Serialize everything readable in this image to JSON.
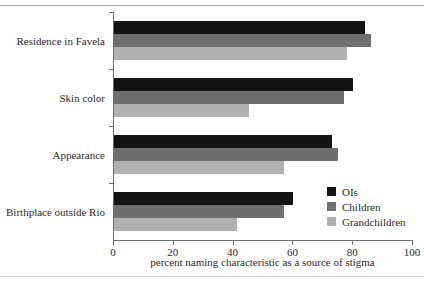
{
  "chart_data": {
    "type": "bar",
    "orientation": "horizontal",
    "title": "",
    "xlabel": "percent naming characteristic as a source of stigma",
    "ylabel": "",
    "xlim": [
      0,
      100
    ],
    "xticks": [
      0,
      20,
      40,
      60,
      80,
      100
    ],
    "grid": false,
    "legend_position": "inside bottom-right",
    "categories": [
      "Residence in Favela",
      "Skin color",
      "Appearance",
      "Birthplace outside Rio"
    ],
    "series": [
      {
        "name": "OIs",
        "color": "#141414",
        "values": [
          84,
          80,
          73,
          60
        ]
      },
      {
        "name": "Children",
        "color": "#6f6f6f",
        "values": [
          86,
          77,
          75,
          57
        ]
      },
      {
        "name": "Grandchildren",
        "color": "#b0b0b0",
        "values": [
          78,
          45,
          57,
          41
        ]
      }
    ]
  },
  "axis": {
    "tick_labels": [
      "0",
      "20",
      "40",
      "60",
      "80",
      "100"
    ],
    "x_title": "percent naming characteristic as a source of stigma"
  },
  "legend": {
    "items": [
      {
        "label": "OIs",
        "color": "#141414"
      },
      {
        "label": "Children",
        "color": "#6f6f6f"
      },
      {
        "label": "Grandchildren",
        "color": "#b0b0b0"
      }
    ]
  }
}
